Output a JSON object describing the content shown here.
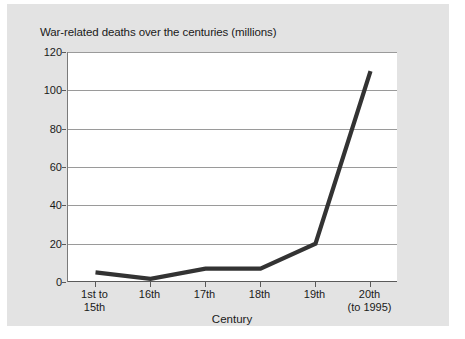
{
  "chart_data": {
    "type": "line",
    "title": "War-related deaths over the centuries (millions)",
    "xlabel": "Century",
    "ylabel": "",
    "categories": [
      "1st to 15th",
      "16th",
      "17th",
      "18th",
      "19th",
      "20th (to 1995)"
    ],
    "category_lines": [
      [
        "1st to",
        "15th"
      ],
      [
        "16th"
      ],
      [
        "17th"
      ],
      [
        "18th"
      ],
      [
        "19th"
      ],
      [
        "20th",
        "(to 1995)"
      ]
    ],
    "values": [
      5,
      1.6,
      7,
      7,
      20,
      110
    ],
    "ylim": [
      0,
      120
    ],
    "yticks": [
      0,
      20,
      40,
      60,
      80,
      100,
      120
    ],
    "ytick_labels": [
      "0",
      "20",
      "40",
      "60",
      "80",
      "100",
      "120"
    ],
    "grid": true,
    "legend": false,
    "series_color": "#333333",
    "panel_color": "#e3e3e3",
    "plot_bg_color": "#ffffff",
    "gridline_color": "#9a9a9a"
  }
}
